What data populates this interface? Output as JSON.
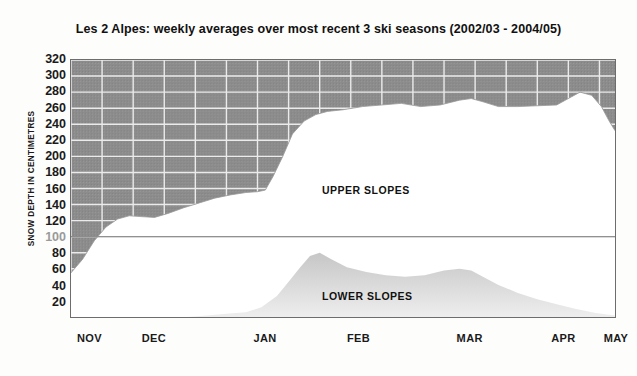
{
  "chart_data": {
    "type": "area",
    "title": "Les 2 Alpes: weekly averages over most recent 3 ski seasons (2002/03 - 2004/05)",
    "subtitle": "",
    "xlabel": "",
    "ylabel": "SNOW DEPTH IN CENTIMETRES",
    "ylim": [
      0,
      320
    ],
    "xlim": [
      0,
      28
    ],
    "grid": true,
    "legend_position": "inline-annotations",
    "y_ticks": [
      320,
      300,
      280,
      260,
      240,
      220,
      200,
      180,
      160,
      140,
      120,
      100,
      80,
      60,
      40,
      20
    ],
    "y_tick_labels": [
      "320",
      "300",
      "280",
      "260",
      "240",
      "220",
      "200",
      "180",
      "160",
      "140",
      "120",
      "100",
      "80",
      "60",
      "40",
      "20"
    ],
    "x_tick_labels": [
      "NOV",
      "DEC",
      "JAN",
      "FEB",
      "MAR",
      "APR",
      "MAY"
    ],
    "x_tick_positions": [
      1.0,
      4.3,
      10.0,
      14.8,
      20.5,
      25.3,
      28.0
    ],
    "annotations": [
      {
        "text": "UPPER SLOPES",
        "x": 14.0,
        "y": 150
      },
      {
        "text": "LOWER SLOPES",
        "x": 14.0,
        "y": 40
      }
    ],
    "series": [
      {
        "name": "UPPER SLOPES",
        "fill_style": "white-below-grey-above",
        "x": [
          0,
          0.6,
          1.2,
          1.8,
          2.4,
          3.0,
          3.6,
          4.3,
          5.0,
          5.8,
          6.6,
          7.4,
          8.2,
          9.0,
          9.6,
          10.0,
          10.4,
          10.9,
          11.4,
          12.0,
          12.6,
          13.2,
          14.0,
          15.0,
          16.0,
          17.0,
          18.0,
          19.0,
          20.0,
          20.6,
          21.2,
          22.0,
          23.0,
          24.0,
          25.0,
          25.6,
          26.2,
          26.8,
          27.3,
          27.7,
          28.0
        ],
        "values": [
          55,
          72,
          95,
          112,
          122,
          126,
          125,
          124,
          129,
          136,
          142,
          148,
          152,
          155,
          156,
          158,
          175,
          200,
          228,
          244,
          252,
          256,
          258,
          262,
          264,
          266,
          262,
          264,
          270,
          272,
          268,
          262,
          262,
          263,
          264,
          272,
          280,
          276,
          262,
          244,
          232
        ]
      },
      {
        "name": "LOWER SLOPES",
        "fill_style": "light-grey",
        "x": [
          0,
          6.0,
          7.0,
          8.0,
          9.0,
          9.8,
          10.6,
          11.2,
          11.8,
          12.3,
          12.8,
          13.4,
          14.2,
          15.2,
          16.2,
          17.2,
          18.2,
          19.2,
          20.0,
          20.6,
          21.2,
          22.0,
          23.0,
          24.0,
          25.0,
          26.0,
          27.0,
          28.0
        ],
        "values": [
          0,
          0,
          2,
          4,
          6,
          12,
          26,
          44,
          62,
          76,
          80,
          72,
          62,
          56,
          52,
          50,
          52,
          58,
          60,
          58,
          50,
          40,
          30,
          22,
          16,
          10,
          5,
          2
        ]
      }
    ],
    "colors": {
      "above_snow_fill": "#8c8c8c",
      "grid_line": "#e8e8e8",
      "upper_slopes_fill": "#ffffff",
      "lower_slopes_fill": "#d9d9d9",
      "axis_line": "#6d6d6d",
      "separator_line": "#6d6d6d",
      "text": "#1a1a1a"
    },
    "separator": {
      "y": 100,
      "note": "horizontal divider line between upper and lower slope panels"
    }
  }
}
